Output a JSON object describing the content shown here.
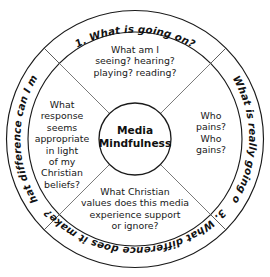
{
  "diagram": {
    "title": "Media Mindfulness",
    "center": {
      "label": "Media\nMindfulness"
    },
    "outer_ring": [
      {
        "id": "step-1",
        "number": "1.",
        "text": "1.  What is going on?",
        "position": "top"
      },
      {
        "id": "step-2",
        "number": "2.",
        "text": "2.  What is really going on?",
        "position": "right"
      },
      {
        "id": "step-3",
        "number": "3.",
        "text": "3.  What difference does it make?",
        "position": "bottom"
      },
      {
        "id": "step-4",
        "number": "4.",
        "text": "4.  What difference can I make?",
        "position": "left"
      }
    ],
    "quadrants": [
      {
        "id": "quadrant-top",
        "position": "top",
        "text": "What am I\nseeing? hearing?\nplaying? reading?"
      },
      {
        "id": "quadrant-right",
        "position": "right",
        "text": "Who\npains?\nWho\ngains?"
      },
      {
        "id": "quadrant-bottom",
        "position": "bottom",
        "text": "What Christian\nvalues does this media\nexperience support\nor ignore?"
      },
      {
        "id": "quadrant-left",
        "position": "left",
        "text": "What\nresponse\nseems\nappropriate\nin light\nof my\nChristian\nbeliefs?"
      }
    ],
    "colors": {
      "background": "#ffffff",
      "stroke": "#1a1a1a",
      "divider": "#6b6b6b",
      "text": "#181818"
    }
  }
}
